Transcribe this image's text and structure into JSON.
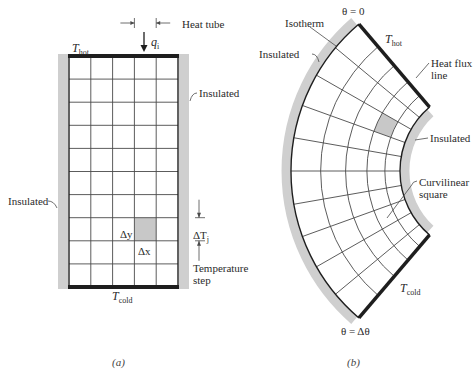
{
  "panel_a": {
    "caption": "(a)",
    "grid": {
      "x": 69,
      "y": 56,
      "width": 109,
      "height": 231,
      "cols": 5,
      "rows": 10,
      "shaded_cell": {
        "col": 3,
        "row": 7
      }
    },
    "labels": {
      "heat_tube": "Heat tube",
      "q_symbol": "q",
      "q_sub": "i",
      "t_hot": "T",
      "t_hot_sub": "hot",
      "t_cold": "T",
      "t_cold_sub": "cold",
      "insulated_right": "Insulated",
      "insulated_left": "Insulated",
      "delta_y": "Δy",
      "delta_x": "Δx",
      "delta_t": "ΔT",
      "delta_t_sub": "j",
      "temperature_step_1": "Temperature",
      "temperature_step_2": "step"
    }
  },
  "panel_b": {
    "caption": "(b)",
    "sector": {
      "cx": 484,
      "cy": 171,
      "r_outer": 193,
      "r_inner": 84,
      "half_angle_deg": 49.6,
      "radial_cells": 5,
      "angular_cells": 10,
      "shaded_cell": {
        "ring": 3,
        "sector": 7
      }
    },
    "labels": {
      "theta_top": "θ = 0",
      "theta_bottom": "θ = Δθ",
      "isotherm": "Isotherm",
      "insulated_outer": "Insulated",
      "t_hot": "T",
      "t_hot_sub": "hot",
      "heat_flux_1": "Heat flux",
      "heat_flux_2": "line",
      "insulated_inner": "Insulated",
      "curvilinear_1": "Curvilinear",
      "curvilinear_2": "square",
      "t_cold": "T",
      "t_cold_sub": "cold"
    }
  },
  "colors": {
    "line": "#4a4a4a",
    "thick": "#1e1e1e",
    "insulation": "#cfcfcf",
    "shade": "#c8c8c8"
  }
}
